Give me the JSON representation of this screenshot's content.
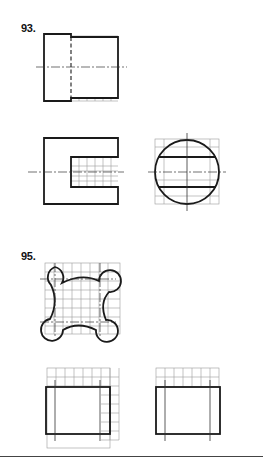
{
  "problems": [
    {
      "number": "93.",
      "views": [
        "front-view",
        "top-view",
        "side-view-circle"
      ]
    },
    {
      "number": "95.",
      "views": [
        "profile-rounded-square",
        "front-view-grid",
        "side-view-grid"
      ]
    }
  ],
  "colors": {
    "line": "#1a1a1a",
    "grid": "#9a9a9a",
    "background": "#ffffff"
  }
}
